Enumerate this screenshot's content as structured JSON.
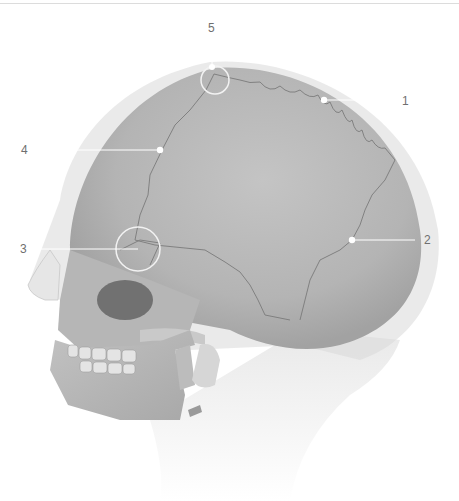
{
  "figure": {
    "colors": {
      "background": "#ffffff",
      "bone": "#bdbdbd",
      "bone_dark": "#a9a9a9",
      "soft_tissue": "#e6e6e6",
      "suture_line": "#7a7a7a",
      "leader_line": "#ffffff",
      "label_text": "#6f6f6f"
    }
  },
  "callouts": [
    {
      "number": "1",
      "label_x": 405,
      "label_y": 128,
      "point_x": 324,
      "point_y": 100
    },
    {
      "number": "2",
      "label_x": 424,
      "label_y": 240,
      "point_x": 352,
      "point_y": 240
    },
    {
      "number": "3",
      "label_x": 22,
      "label_y": 249,
      "point_x": 138,
      "point_y": 249
    },
    {
      "number": "4",
      "label_x": 22,
      "label_y": 152,
      "point_x": 160,
      "point_y": 150
    },
    {
      "number": "5",
      "label_x": 208,
      "label_y": 29,
      "point_x": 212,
      "point_y": 67
    }
  ]
}
